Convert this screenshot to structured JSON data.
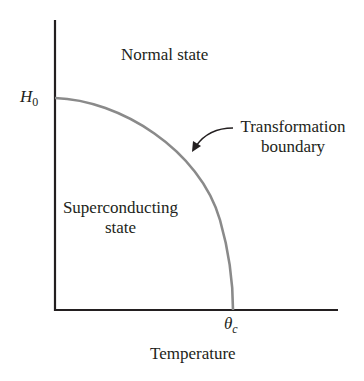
{
  "diagram": {
    "regions": {
      "normal": "Normal state",
      "superconducting_line1": "Superconducting",
      "superconducting_line2": "state"
    },
    "y_axis": {
      "tick_label_main": "H",
      "tick_label_sub": "0"
    },
    "x_axis": {
      "tick_label_main": "θ",
      "tick_label_sub": "c",
      "label": "Temperature"
    },
    "annotation": {
      "line1": "Transformation",
      "line2": "boundary"
    },
    "colors": {
      "axis": "#231f20",
      "curve": "#8a8a8a",
      "text": "#231f20"
    }
  }
}
